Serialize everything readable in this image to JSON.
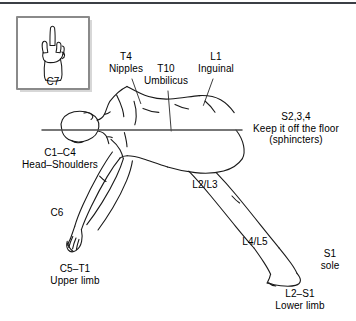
{
  "figure": {
    "background_color": "#ffffff",
    "ink_color": "#1a1a1a",
    "rule_color": "#3b3f45"
  },
  "inset": {
    "name": "c7-hand-inset",
    "caption": "C7",
    "border_color": "#8a8a8a",
    "shadow_color": "#b9b9b9",
    "description": "hand with extended middle finger"
  },
  "labels": [
    {
      "id": "t4",
      "lines": [
        "T4",
        "Nipples"
      ],
      "x": 126,
      "y": 56,
      "align": "center"
    },
    {
      "id": "t10",
      "lines": [
        "T10",
        "Umbilicus"
      ],
      "x": 166,
      "y": 68,
      "align": "center"
    },
    {
      "id": "l1",
      "lines": [
        "L1",
        "Inguinal"
      ],
      "x": 216,
      "y": 56,
      "align": "center"
    },
    {
      "id": "s234",
      "lines": [
        "S2,3,4",
        "Keep it off the floor",
        "(sphincters)"
      ],
      "x": 296,
      "y": 116,
      "align": "center"
    },
    {
      "id": "c1c4",
      "lines": [
        "C1–C4",
        "Head–Shoulders"
      ],
      "x": 60,
      "y": 152,
      "align": "center"
    },
    {
      "id": "c6",
      "lines": [
        "C6"
      ],
      "x": 57,
      "y": 212,
      "align": "center"
    },
    {
      "id": "c5t1",
      "lines": [
        "C5–T1",
        "Upper limb"
      ],
      "x": 75,
      "y": 268,
      "align": "center"
    },
    {
      "id": "l2l3",
      "lines": [
        "L2/L3"
      ],
      "x": 205,
      "y": 184,
      "align": "center"
    },
    {
      "id": "l4l5",
      "lines": [
        "L4/L5"
      ],
      "x": 255,
      "y": 241,
      "align": "center"
    },
    {
      "id": "s1",
      "lines": [
        "S1",
        "sole"
      ],
      "x": 330,
      "y": 253,
      "align": "center"
    },
    {
      "id": "l2s1",
      "lines": [
        "L2–S1",
        "Lower limb"
      ],
      "x": 300,
      "y": 293,
      "align": "center"
    }
  ],
  "floor_line": {
    "name": "floor-reference-line",
    "x1": 42,
    "y1": 130,
    "x2": 242,
    "y2": 130,
    "color": "#4b4b4b"
  }
}
